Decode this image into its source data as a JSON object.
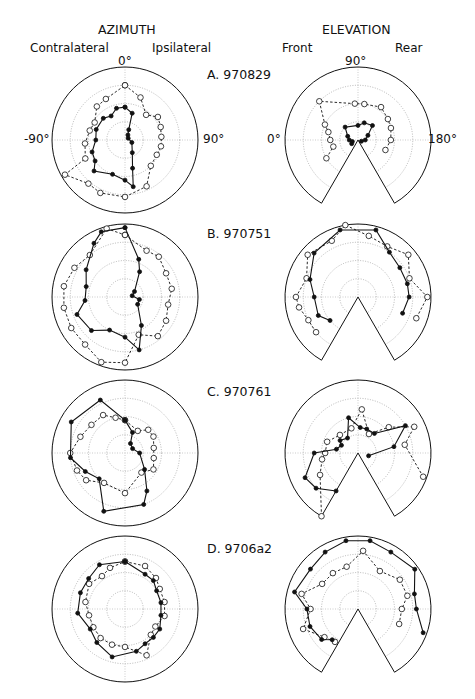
{
  "chart_data": {
    "type": "polar-scatter-line",
    "title": "",
    "columns": [
      {
        "title": "AZIMUTH",
        "left_label": "Contralateral",
        "right_label": "Ipsilateral",
        "ticks": {
          "top": "0°",
          "left": "-90°",
          "right": "90°"
        }
      },
      {
        "title": "ELEVATION",
        "left_label": "Front",
        "right_label": "Rear",
        "ticks": {
          "top": "90°",
          "left": "0°",
          "right": "180°"
        }
      }
    ],
    "legend": [
      {
        "name": "filled circles, solid line",
        "marker": "filled"
      },
      {
        "name": "open circles, dashed line",
        "marker": "open"
      }
    ],
    "radial_grid": [
      0.25,
      0.5,
      0.75
    ],
    "elevation_range_deg": [
      -60,
      240
    ],
    "panels": [
      {
        "label": "A. 970829",
        "azimuth": {
          "filled": [
            [
              0,
              0.45
            ],
            [
              15,
              0.38
            ],
            [
              20,
              0.15
            ],
            [
              30,
              0.08
            ],
            [
              60,
              0.05
            ],
            [
              110,
              0.1
            ],
            [
              150,
              0.2
            ],
            [
              165,
              0.4
            ],
            [
              170,
              0.65
            ],
            [
              180,
              0.55
            ],
            [
              200,
              0.5
            ],
            [
              225,
              0.6
            ],
            [
              235,
              0.5
            ],
            [
              250,
              0.48
            ],
            [
              270,
              0.4
            ],
            [
              290,
              0.42
            ],
            [
              315,
              0.42
            ],
            [
              330,
              0.38
            ],
            [
              345,
              0.45
            ],
            [
              0,
              0.45
            ]
          ],
          "open": [
            [
              0,
              0.75
            ],
            [
              20,
              0.62
            ],
            [
              40,
              0.45
            ],
            [
              55,
              0.55
            ],
            [
              70,
              0.52
            ],
            [
              85,
              0.5
            ],
            [
              100,
              0.5
            ],
            [
              115,
              0.48
            ],
            [
              135,
              0.5
            ],
            [
              155,
              0.7
            ],
            [
              180,
              0.78
            ],
            [
              205,
              0.8
            ],
            [
              220,
              0.78
            ],
            [
              240,
              0.95
            ],
            [
              245,
              0.6
            ],
            [
              265,
              0.55
            ],
            [
              285,
              0.5
            ],
            [
              300,
              0.48
            ],
            [
              320,
              0.6
            ],
            [
              335,
              0.62
            ],
            [
              0,
              0.75
            ]
          ]
        },
        "elevation": {
          "filled": [
            [
              -30,
              0.1
            ],
            [
              -15,
              0.08
            ],
            [
              0,
              0.12
            ],
            [
              20,
              0.15
            ],
            [
              45,
              0.25
            ],
            [
              90,
              0.2
            ],
            [
              110,
              0.25
            ],
            [
              135,
              0.28
            ],
            [
              155,
              0.15
            ],
            [
              180,
              0.1
            ],
            [
              200,
              0.05
            ]
          ],
          "open": [
            [
              -30,
              0.5
            ],
            [
              -15,
              0.35
            ],
            [
              0,
              0.38
            ],
            [
              15,
              0.42
            ],
            [
              25,
              0.5
            ],
            [
              45,
              0.75
            ],
            [
              85,
              0.5
            ],
            [
              100,
              0.5
            ],
            [
              125,
              0.55
            ],
            [
              145,
              0.5
            ],
            [
              160,
              0.48
            ],
            [
              180,
              0.45
            ],
            [
              200,
              0.4
            ]
          ]
        }
      },
      {
        "label": "B. 970751",
        "azimuth": {
          "filled": [
            [
              0,
              0.95
            ],
            [
              20,
              0.55
            ],
            [
              30,
              0.4
            ],
            [
              60,
              0.15
            ],
            [
              80,
              0.1
            ],
            [
              100,
              0.2
            ],
            [
              120,
              0.2
            ],
            [
              150,
              0.45
            ],
            [
              165,
              0.75
            ],
            [
              180,
              0.55
            ],
            [
              205,
              0.5
            ],
            [
              225,
              0.65
            ],
            [
              250,
              0.7
            ],
            [
              265,
              0.55
            ],
            [
              285,
              0.55
            ],
            [
              305,
              0.65
            ],
            [
              330,
              0.85
            ],
            [
              340,
              0.95
            ],
            [
              0,
              0.95
            ]
          ],
          "open": [
            [
              0,
              0.85
            ],
            [
              25,
              0.7
            ],
            [
              40,
              0.72
            ],
            [
              60,
              0.65
            ],
            [
              80,
              0.65
            ],
            [
              100,
              0.6
            ],
            [
              120,
              0.65
            ],
            [
              140,
              0.7
            ],
            [
              160,
              0.55
            ],
            [
              180,
              0.9
            ],
            [
              200,
              0.95
            ],
            [
              220,
              0.85
            ],
            [
              240,
              0.85
            ],
            [
              260,
              0.85
            ],
            [
              280,
              0.85
            ],
            [
              300,
              0.8
            ],
            [
              320,
              0.75
            ],
            [
              345,
              0.97
            ],
            [
              0,
              0.85
            ]
          ]
        },
        "elevation": {
          "filled": [
            [
              -40,
              0.5
            ],
            [
              -25,
              0.6
            ],
            [
              0,
              0.6
            ],
            [
              20,
              0.7
            ],
            [
              45,
              0.85
            ],
            [
              75,
              0.95
            ],
            [
              105,
              0.95
            ],
            [
              125,
              0.75
            ],
            [
              145,
              0.7
            ],
            [
              165,
              0.7
            ],
            [
              180,
              0.7
            ],
            [
              200,
              0.65
            ]
          ],
          "open": [
            [
              -40,
              0.75
            ],
            [
              -25,
              0.75
            ],
            [
              -10,
              0.82
            ],
            [
              0,
              0.85
            ],
            [
              20,
              0.75
            ],
            [
              40,
              0.9
            ],
            [
              65,
              0.85
            ],
            [
              80,
              1.0
            ],
            [
              100,
              0.85
            ],
            [
              120,
              0.8
            ],
            [
              140,
              0.9
            ],
            [
              160,
              0.75
            ],
            [
              180,
              0.95
            ],
            [
              200,
              0.85
            ]
          ]
        }
      },
      {
        "label": "C. 970761",
        "azimuth": {
          "filled": [
            [
              0,
              0.45
            ],
            [
              20,
              0.3
            ],
            [
              30,
              0.15
            ],
            [
              60,
              0.12
            ],
            [
              90,
              0.2
            ],
            [
              130,
              0.35
            ],
            [
              150,
              0.6
            ],
            [
              160,
              0.75
            ],
            [
              200,
              0.85
            ],
            [
              225,
              0.5
            ],
            [
              245,
              0.6
            ],
            [
              265,
              0.75
            ],
            [
              300,
              0.85
            ],
            [
              335,
              0.8
            ],
            [
              0,
              0.45
            ]
          ],
          "open": [
            [
              0,
              0.45
            ],
            [
              30,
              0.35
            ],
            [
              45,
              0.45
            ],
            [
              60,
              0.45
            ],
            [
              80,
              0.4
            ],
            [
              100,
              0.4
            ],
            [
              120,
              0.45
            ],
            [
              140,
              0.35
            ],
            [
              180,
              0.55
            ],
            [
              215,
              0.5
            ],
            [
              235,
              0.65
            ],
            [
              250,
              0.7
            ],
            [
              270,
              0.75
            ],
            [
              290,
              0.65
            ],
            [
              310,
              0.6
            ],
            [
              330,
              0.6
            ],
            [
              345,
              0.5
            ],
            [
              0,
              0.45
            ]
          ]
        },
        "elevation": {
          "filled": [
            [
              -60,
              0.6
            ],
            [
              -40,
              0.75
            ],
            [
              -25,
              0.8
            ],
            [
              0,
              0.6
            ],
            [
              10,
              0.3
            ],
            [
              25,
              0.25
            ],
            [
              35,
              0.3
            ],
            [
              55,
              0.25
            ],
            [
              75,
              0.5
            ],
            [
              95,
              0.35
            ],
            [
              110,
              0.35
            ],
            [
              130,
              0.35
            ],
            [
              150,
              0.75
            ],
            [
              170,
              0.5
            ],
            [
              195,
              0.15
            ]
          ],
          "open": [
            [
              -60,
              1.0
            ],
            [
              -30,
              0.6
            ],
            [
              -10,
              0.5
            ],
            [
              0,
              0.45
            ],
            [
              20,
              0.45
            ],
            [
              45,
              0.35
            ],
            [
              75,
              0.35
            ],
            [
              95,
              0.6
            ],
            [
              120,
              0.3
            ],
            [
              140,
              0.55
            ],
            [
              155,
              0.85
            ],
            [
              170,
              0.65
            ],
            [
              200,
              0.95
            ]
          ]
        }
      },
      {
        "label": "D. 9706a2",
        "azimuth": {
          "filled": [
            [
              0,
              0.65
            ],
            [
              30,
              0.55
            ],
            [
              45,
              0.55
            ],
            [
              60,
              0.5
            ],
            [
              80,
              0.5
            ],
            [
              100,
              0.5
            ],
            [
              120,
              0.55
            ],
            [
              135,
              0.55
            ],
            [
              150,
              0.55
            ],
            [
              165,
              0.6
            ],
            [
              195,
              0.68
            ],
            [
              220,
              0.6
            ],
            [
              240,
              0.55
            ],
            [
              265,
              0.65
            ],
            [
              290,
              0.65
            ],
            [
              310,
              0.65
            ],
            [
              330,
              0.7
            ],
            [
              0,
              0.65
            ]
          ],
          "open": [
            [
              0,
              0.65
            ],
            [
              25,
              0.65
            ],
            [
              45,
              0.6
            ],
            [
              60,
              0.55
            ],
            [
              80,
              0.55
            ],
            [
              100,
              0.55
            ],
            [
              120,
              0.48
            ],
            [
              135,
              0.5
            ],
            [
              155,
              0.7
            ],
            [
              180,
              0.52
            ],
            [
              200,
              0.52
            ],
            [
              220,
              0.52
            ],
            [
              240,
              0.5
            ],
            [
              260,
              0.5
            ],
            [
              280,
              0.55
            ],
            [
              305,
              0.6
            ],
            [
              325,
              0.55
            ],
            [
              340,
              0.6
            ],
            [
              0,
              0.65
            ]
          ]
        },
        "elevation": {
          "filled": [
            [
              -50,
              0.55
            ],
            [
              -40,
              0.65
            ],
            [
              -20,
              0.7
            ],
            [
              0,
              0.7
            ],
            [
              15,
              0.9
            ],
            [
              40,
              0.85
            ],
            [
              60,
              0.9
            ],
            [
              80,
              0.95
            ],
            [
              100,
              0.95
            ],
            [
              120,
              0.9
            ],
            [
              145,
              0.95
            ],
            [
              165,
              0.8
            ],
            [
              180,
              0.8
            ],
            [
              200,
              0.95
            ]
          ],
          "open": [
            [
              -55,
              0.55
            ],
            [
              -40,
              0.6
            ],
            [
              -20,
              0.8
            ],
            [
              0,
              0.65
            ],
            [
              15,
              0.8
            ],
            [
              35,
              0.6
            ],
            [
              55,
              0.6
            ],
            [
              75,
              0.6
            ],
            [
              95,
              0.8
            ],
            [
              120,
              0.6
            ],
            [
              145,
              0.7
            ],
            [
              165,
              0.7
            ],
            [
              180,
              0.6
            ],
            [
              200,
              0.6
            ]
          ]
        }
      }
    ]
  }
}
